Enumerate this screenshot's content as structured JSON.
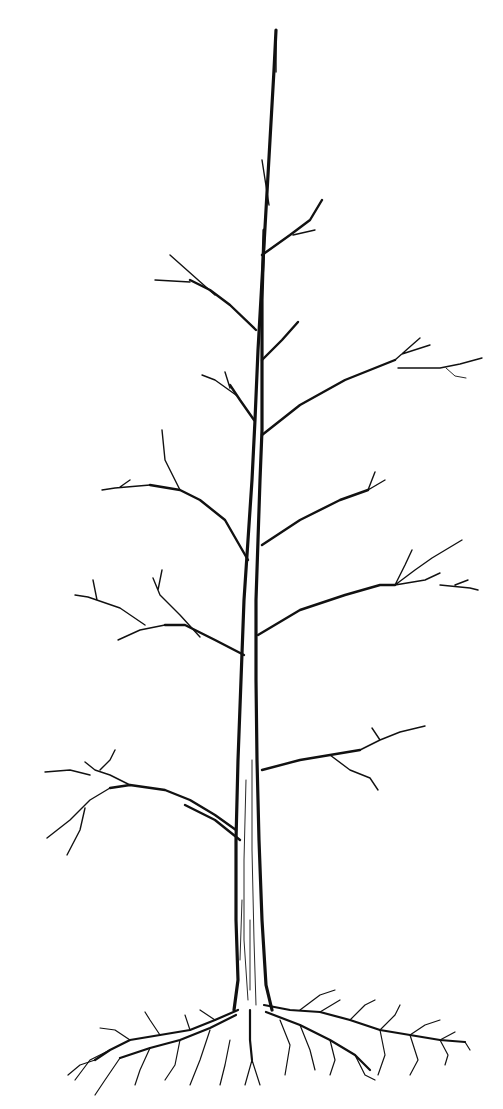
{
  "image": {
    "subject": "bare deciduous tree with exposed roots",
    "style": "black ink line drawing on white",
    "colors": {
      "background": "#ffffff",
      "ink": "#111111"
    }
  }
}
